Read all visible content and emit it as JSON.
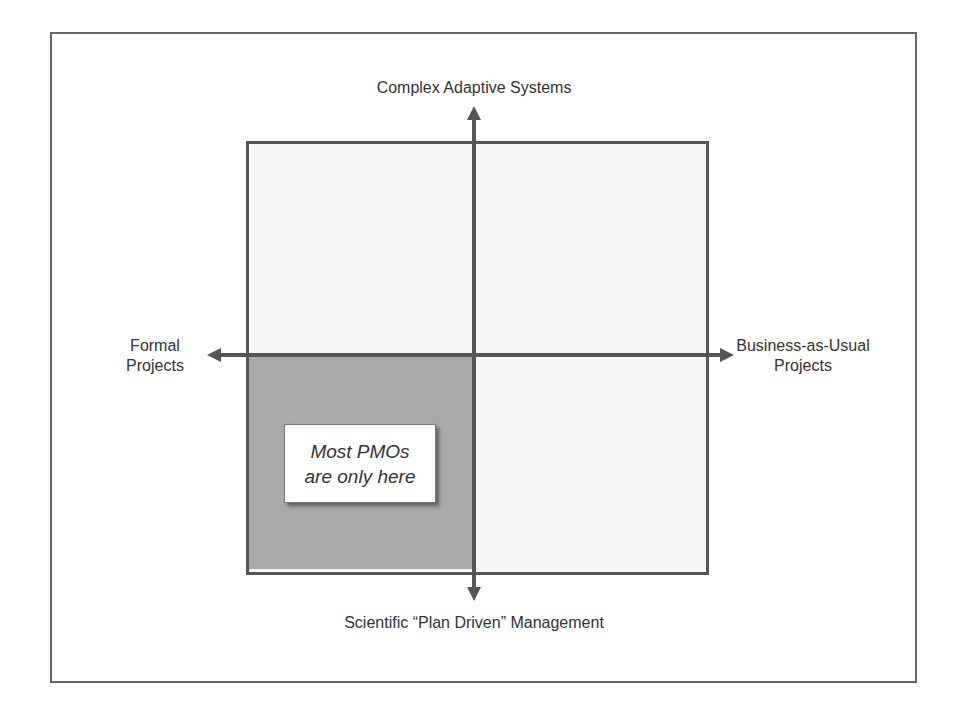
{
  "diagram": {
    "axes": {
      "top": "Complex Adaptive Systems",
      "bottom": "Scientific “Plan Driven” Management",
      "left": [
        "Formal",
        "Projects"
      ],
      "right": [
        "Business-as-Usual",
        "Projects"
      ]
    },
    "callout": {
      "lines": [
        "Most PMOs",
        "are only here"
      ]
    },
    "colors": {
      "axis": "#555555",
      "shaded_quadrant": "#aaaaaa",
      "unshaded_quadrant": "#f6f6f6",
      "frame": "#666666",
      "text": "#333333"
    },
    "highlighted_quadrant": "bottom-left"
  }
}
